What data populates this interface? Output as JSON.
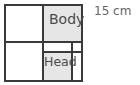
{
  "diagram": {
    "dimension_label": "15 cm",
    "cells": {
      "body": {
        "label": "Body",
        "fill": "#e6e6e6"
      },
      "head": {
        "label": "Head",
        "fill": "#e6e6e6"
      }
    },
    "line_color": "#3a3a3a"
  }
}
